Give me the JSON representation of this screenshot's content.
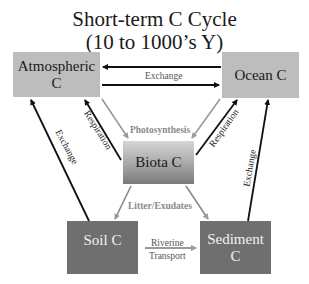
{
  "title": {
    "line1": "Short-term C Cycle",
    "line2": "(10 to 1000’s Y)"
  },
  "boxes": {
    "atmospheric": "Atmospheric C",
    "ocean": "Ocean C",
    "biota": "Biota C",
    "soil": "Soil C",
    "sediment_line1": "Sediment",
    "sediment_line2": "C"
  },
  "flows": {
    "atm_ocean_exchange": "Exchange",
    "photosynthesis": "Photosynthesis",
    "respiration_left": "Respiration",
    "respiration_right": "Respiration",
    "exchange_left": "Exchange",
    "exchange_right": "Exchange",
    "litter": "Litter/Exudates",
    "riverine_line1": "Riverine",
    "riverine_line2": "Transport"
  },
  "colors": {
    "reservoir_light": "#bdbdbd",
    "reservoir_dark": "#6f6f6f",
    "arrow_black": "#111111",
    "arrow_gray": "#9a9a9a"
  }
}
